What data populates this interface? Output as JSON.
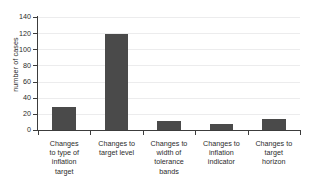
{
  "chart_data": {
    "type": "bar",
    "title": "",
    "xlabel": "",
    "ylabel": "number of cases",
    "categories": [
      "Changes to type of inflation target",
      "Changes to target level",
      "Changes to width of tolerance bands",
      "Changes to inflation indicator",
      "Changes to target horizon"
    ],
    "category_lines": [
      [
        "Changes",
        "to type of",
        "inflation",
        "target"
      ],
      [
        "Changes to",
        "target level"
      ],
      [
        "Changes to",
        "width of",
        "tolerance",
        "bands"
      ],
      [
        "Changes to",
        "inflation",
        "indicator"
      ],
      [
        "Changes to",
        "target",
        "horizon"
      ]
    ],
    "values": [
      28,
      119,
      11,
      8,
      14
    ],
    "ylim": [
      0,
      140
    ],
    "ytick_labels": [
      "0",
      "20",
      "40",
      "60",
      "80",
      "100",
      "120",
      "140"
    ],
    "ytick_values": [
      0,
      20,
      40,
      60,
      80,
      100,
      120,
      140
    ],
    "grid": true,
    "legend": false,
    "colors": {
      "bar": "#4a4a4a",
      "axis": "#3c3c3c",
      "grid": "#ececed",
      "text": "#2b2b2b",
      "background": "#ffffff"
    }
  }
}
